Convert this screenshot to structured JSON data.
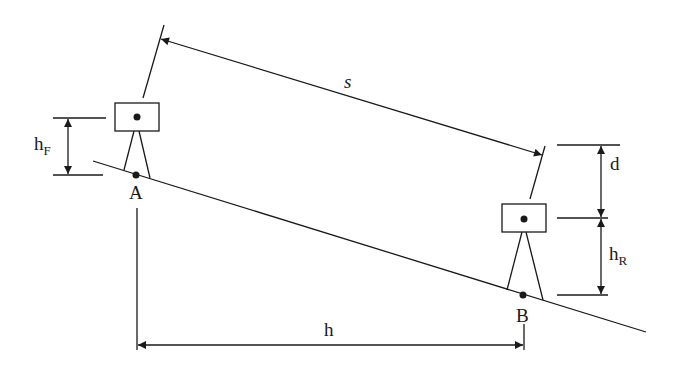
{
  "diagram": {
    "type": "surveying-slope-distance",
    "colors": {
      "stroke": "#1a1a1a",
      "background": "#ffffff"
    },
    "points": {
      "A": {
        "label": "A"
      },
      "B": {
        "label": "B"
      }
    },
    "labels": {
      "slope_distance": "s",
      "horizontal_distance": "h",
      "height_difference": "d",
      "instrument_height_front": "h",
      "instrument_height_front_sub": "F",
      "instrument_height_rear": "h",
      "instrument_height_rear_sub": "R"
    }
  }
}
